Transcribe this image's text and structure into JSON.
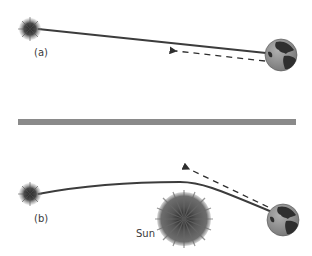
{
  "panels": [
    {
      "id": "a",
      "label": "(a)",
      "description": "Straight light path from distant star to Earth; apparent direction shown by dashed arrow"
    },
    {
      "id": "b",
      "label": "(b)",
      "description": "Light from distant star bent by the Sun's gravity; apparent direction shown by dashed arrow",
      "sun_label": "Sun"
    }
  ],
  "colors": {
    "background": "#ffffff",
    "light_path": "#3c3c3c",
    "divider": "#8a8a8a",
    "star": "#4a4a4a",
    "sun": "#5a5a5a",
    "earth_ocean": "#9a9a9a",
    "earth_land": "#2e2e2e",
    "label": "#3a3a3a"
  },
  "icons": [
    "star-icon",
    "earth-icon",
    "sun-icon",
    "dashed-arrow-icon"
  ]
}
